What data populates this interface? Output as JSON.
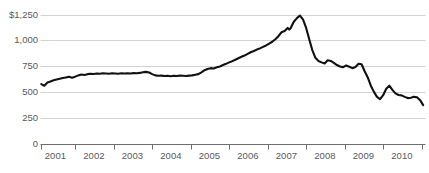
{
  "chart_data": {
    "type": "line",
    "title": "",
    "xlabel": "",
    "ylabel": "",
    "ylim": [
      0,
      1250
    ],
    "xlim": [
      2000.6,
      2010.6
    ],
    "grid": true,
    "legend": null,
    "currency_prefix": "$",
    "line_color": "#111111",
    "grid_color": "#d2d2d2",
    "axis_color": "#6e6e70",
    "label_color": "#58585a",
    "ytick_labels": [
      "$1,250",
      "1,000",
      "750",
      "500",
      "250",
      "0"
    ],
    "ytick_values": [
      1250,
      1000,
      750,
      500,
      250,
      0
    ],
    "xtick_labels": [
      "2001",
      "2002",
      "2003",
      "2004",
      "2005",
      "2006",
      "2007",
      "2008",
      "2009",
      "2010"
    ],
    "xtick_values": [
      2001,
      2002,
      2003,
      2004,
      2005,
      2006,
      2007,
      2008,
      2009,
      2010
    ],
    "series": [
      {
        "name": "index",
        "x": [
          2000.62,
          2000.7,
          2000.78,
          2000.86,
          2000.94,
          2001.02,
          2001.1,
          2001.18,
          2001.26,
          2001.34,
          2001.42,
          2001.5,
          2001.58,
          2001.66,
          2001.74,
          2001.82,
          2001.9,
          2001.98,
          2002.06,
          2002.14,
          2002.22,
          2002.3,
          2002.38,
          2002.46,
          2002.54,
          2002.62,
          2002.7,
          2002.78,
          2002.86,
          2002.94,
          2003.02,
          2003.1,
          2003.18,
          2003.26,
          2003.34,
          2003.42,
          2003.5,
          2003.58,
          2003.66,
          2003.74,
          2003.82,
          2003.9,
          2003.98,
          2004.06,
          2004.14,
          2004.22,
          2004.3,
          2004.38,
          2004.46,
          2004.54,
          2004.62,
          2004.7,
          2004.78,
          2004.86,
          2004.94,
          2005.02,
          2005.1,
          2005.18,
          2005.26,
          2005.34,
          2005.42,
          2005.5,
          2005.58,
          2005.66,
          2005.74,
          2005.82,
          2005.9,
          2005.98,
          2006.06,
          2006.14,
          2006.22,
          2006.3,
          2006.38,
          2006.46,
          2006.54,
          2006.62,
          2006.7,
          2006.78,
          2006.86,
          2006.94,
          2007.02,
          2007.06,
          2007.1,
          2007.14,
          2007.18,
          2007.26,
          2007.34,
          2007.42,
          2007.5,
          2007.58,
          2007.66,
          2007.74,
          2007.82,
          2007.9,
          2007.98,
          2008.06,
          2008.14,
          2008.22,
          2008.3,
          2008.38,
          2008.46,
          2008.54,
          2008.62,
          2008.7,
          2008.78,
          2008.86,
          2008.94,
          2009.02,
          2009.1,
          2009.18,
          2009.26,
          2009.34,
          2009.42,
          2009.5,
          2009.58,
          2009.66,
          2009.74,
          2009.82,
          2009.9,
          2009.98,
          2010.06,
          2010.14,
          2010.22,
          2010.3,
          2010.38,
          2010.46,
          2010.54
        ],
        "y": [
          575,
          560,
          590,
          600,
          612,
          620,
          628,
          634,
          640,
          646,
          638,
          648,
          660,
          668,
          664,
          672,
          676,
          674,
          678,
          676,
          680,
          678,
          676,
          680,
          678,
          676,
          680,
          678,
          680,
          678,
          682,
          680,
          684,
          690,
          694,
          688,
          672,
          660,
          656,
          658,
          654,
          656,
          652,
          656,
          654,
          658,
          656,
          654,
          658,
          660,
          666,
          672,
          690,
          710,
          722,
          730,
          726,
          738,
          746,
          760,
          772,
          786,
          798,
          812,
          826,
          840,
          852,
          868,
          884,
          896,
          910,
          922,
          936,
          950,
          968,
          986,
          1010,
          1040,
          1078,
          1090,
          1120,
          1104,
          1120,
          1150,
          1180,
          1215,
          1240,
          1200,
          1120,
          1010,
          905,
          830,
          800,
          786,
          776,
          806,
          800,
          782,
          760,
          746,
          740,
          756,
          744,
          730,
          742,
          772,
          768,
          700,
          640,
          560,
          500,
          452,
          430,
          468,
          530,
          560,
          520,
          486,
          470,
          466,
          452,
          440,
          444,
          452,
          448,
          420,
          372
        ]
      }
    ]
  },
  "axes": {
    "y_labels": [
      {
        "text": "$1,250",
        "value": 1250
      },
      {
        "text": "1,000",
        "value": 1000
      },
      {
        "text": "750",
        "value": 750
      },
      {
        "text": "500",
        "value": 500
      },
      {
        "text": "250",
        "value": 250
      },
      {
        "text": "0",
        "value": 0
      }
    ],
    "x_labels": [
      {
        "text": "2001",
        "value": 2001
      },
      {
        "text": "2002",
        "value": 2002
      },
      {
        "text": "2003",
        "value": 2003
      },
      {
        "text": "2004",
        "value": 2004
      },
      {
        "text": "2005",
        "value": 2005
      },
      {
        "text": "2006",
        "value": 2006
      },
      {
        "text": "2007",
        "value": 2007
      },
      {
        "text": "2008",
        "value": 2008
      },
      {
        "text": "2009",
        "value": 2009
      },
      {
        "text": "2010",
        "value": 2010
      }
    ]
  },
  "header": {
    "title": ""
  }
}
